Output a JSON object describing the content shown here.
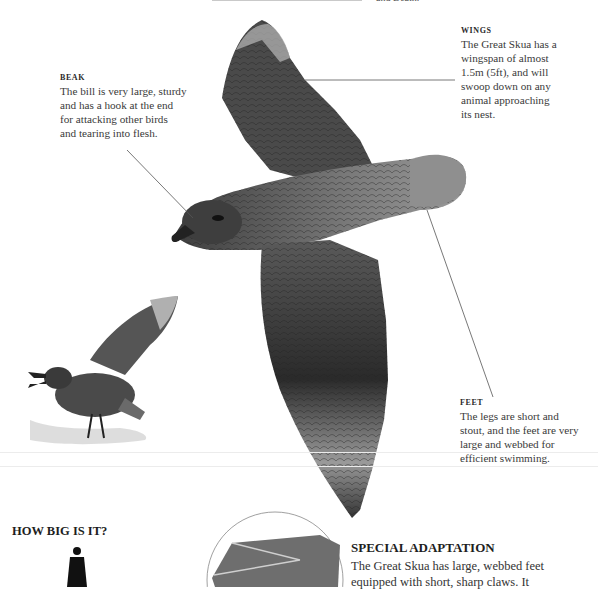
{
  "page": {
    "top_fragment": "and Death."
  },
  "callouts": {
    "beak": {
      "heading": "BEAK",
      "lines": [
        "The bill is very large, sturdy",
        "and has a hook at the end",
        "for attacking other birds",
        "and tearing into flesh."
      ]
    },
    "wings": {
      "heading": "WINGS",
      "lines": [
        "The Great Skua has a",
        "wingspan of almost",
        "1.5m (5ft), and will",
        "swoop down on any",
        "animal approaching",
        "its nest."
      ]
    },
    "feet": {
      "heading": "FEET",
      "lines": [
        "The legs are short and",
        "stout, and the feet are very",
        "large and webbed for",
        "efficient swimming."
      ]
    }
  },
  "how_big": {
    "title": "HOW BIG IS IT?"
  },
  "special_adaptation": {
    "title": "SPECIAL ADAPTATION",
    "lines": [
      "The Great Skua has large, webbed feet",
      "equipped with short, sharp claws. It"
    ]
  },
  "colors": {
    "text": "#3a3a3a",
    "heading": "#1e1e1e",
    "leader_line": "#555555",
    "bird_dark": "#2b2b2b",
    "bird_mid": "#6d6d6d",
    "bird_light": "#bdbdbd"
  }
}
